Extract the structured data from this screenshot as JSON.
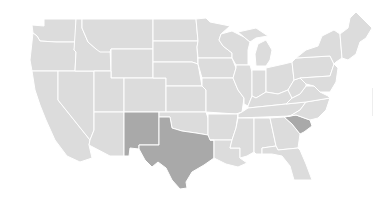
{
  "map": {
    "type": "choropleth",
    "region": "United States",
    "colors": {
      "default": "#dcdcdc",
      "highlight": "#a9a9a9",
      "border": "#ffffff",
      "background": "#ffffff"
    },
    "highlighted_states": [
      "New Mexico",
      "Texas",
      "South Carolina"
    ],
    "states": [
      {
        "id": "WA",
        "name": "Washington",
        "highlighted": false
      },
      {
        "id": "OR",
        "name": "Oregon",
        "highlighted": false
      },
      {
        "id": "CA",
        "name": "California",
        "highlighted": false
      },
      {
        "id": "NV",
        "name": "Nevada",
        "highlighted": false
      },
      {
        "id": "ID",
        "name": "Idaho",
        "highlighted": false
      },
      {
        "id": "MT",
        "name": "Montana",
        "highlighted": false
      },
      {
        "id": "WY",
        "name": "Wyoming",
        "highlighted": false
      },
      {
        "id": "UT",
        "name": "Utah",
        "highlighted": false
      },
      {
        "id": "AZ",
        "name": "Arizona",
        "highlighted": false
      },
      {
        "id": "CO",
        "name": "Colorado",
        "highlighted": false
      },
      {
        "id": "NM",
        "name": "New Mexico",
        "highlighted": true
      },
      {
        "id": "ND",
        "name": "North Dakota",
        "highlighted": false
      },
      {
        "id": "SD",
        "name": "South Dakota",
        "highlighted": false
      },
      {
        "id": "NE",
        "name": "Nebraska",
        "highlighted": false
      },
      {
        "id": "KS",
        "name": "Kansas",
        "highlighted": false
      },
      {
        "id": "OK",
        "name": "Oklahoma",
        "highlighted": false
      },
      {
        "id": "TX",
        "name": "Texas",
        "highlighted": true
      },
      {
        "id": "MN",
        "name": "Minnesota",
        "highlighted": false
      },
      {
        "id": "IA",
        "name": "Iowa",
        "highlighted": false
      },
      {
        "id": "MO",
        "name": "Missouri",
        "highlighted": false
      },
      {
        "id": "AR",
        "name": "Arkansas",
        "highlighted": false
      },
      {
        "id": "LA",
        "name": "Louisiana",
        "highlighted": false
      },
      {
        "id": "WI",
        "name": "Wisconsin",
        "highlighted": false
      },
      {
        "id": "IL",
        "name": "Illinois",
        "highlighted": false
      },
      {
        "id": "MI",
        "name": "Michigan",
        "highlighted": false
      },
      {
        "id": "IN",
        "name": "Indiana",
        "highlighted": false
      },
      {
        "id": "OH",
        "name": "Ohio",
        "highlighted": false
      },
      {
        "id": "KY",
        "name": "Kentucky",
        "highlighted": false
      },
      {
        "id": "TN",
        "name": "Tennessee",
        "highlighted": false
      },
      {
        "id": "MS",
        "name": "Mississippi",
        "highlighted": false
      },
      {
        "id": "AL",
        "name": "Alabama",
        "highlighted": false
      },
      {
        "id": "GA",
        "name": "Georgia",
        "highlighted": false
      },
      {
        "id": "FL",
        "name": "Florida",
        "highlighted": false
      },
      {
        "id": "SC",
        "name": "South Carolina",
        "highlighted": true
      },
      {
        "id": "NC",
        "name": "North Carolina",
        "highlighted": false
      },
      {
        "id": "VA",
        "name": "Virginia",
        "highlighted": false
      },
      {
        "id": "WV",
        "name": "West Virginia",
        "highlighted": false
      },
      {
        "id": "PA",
        "name": "Pennsylvania",
        "highlighted": false
      },
      {
        "id": "NY",
        "name": "New York",
        "highlighted": false
      },
      {
        "id": "NE_REGION",
        "name": "New England",
        "highlighted": false
      },
      {
        "id": "MID_ATL",
        "name": "Mid-Atlantic (NJ/DE/MD)",
        "highlighted": false
      }
    ]
  }
}
